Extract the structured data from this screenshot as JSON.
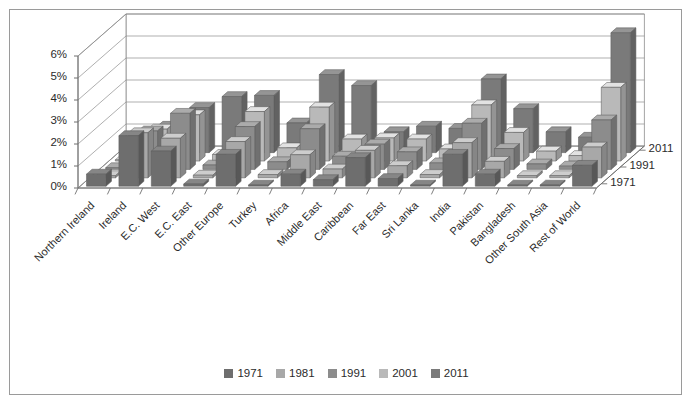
{
  "figure": {
    "border_color": "#9a9a9a",
    "background": "#ffffff"
  },
  "axes": {
    "y_ticks": [
      "0%",
      "1%",
      "2%",
      "3%",
      "4%",
      "5%",
      "6%"
    ],
    "y_min": 0,
    "y_max": 6,
    "y_unit": "%",
    "depth_ticks": [
      "1971",
      "1991",
      "2011"
    ],
    "grid": true
  },
  "legend": {
    "position": "bottom-center",
    "entries": [
      {
        "label": "1971",
        "color": "#6e6e6e"
      },
      {
        "label": "1981",
        "color": "#a8a8a8"
      },
      {
        "label": "1991",
        "color": "#8c8c8c"
      },
      {
        "label": "2001",
        "color": "#b9b9b9"
      },
      {
        "label": "2011",
        "color": "#7a7a7a"
      }
    ]
  },
  "chart_data": {
    "type": "bar",
    "subtype": "3d-clustered-column",
    "title": "",
    "xlabel": "",
    "ylabel": "",
    "ylim": [
      0,
      6
    ],
    "grid": true,
    "categories": [
      "Northern Ireland",
      "Ireland",
      "E.C. West",
      "E.C. East",
      "Other Europe",
      "Turkey",
      "Africa",
      "Middle East",
      "Caribbean",
      "Far East",
      "Sri Lanka",
      "India",
      "Pakistan",
      "Bangladesh",
      "Other South Asia",
      "Rest of World"
    ],
    "series": [
      {
        "name": "1971",
        "color": "#6e6e6e",
        "values": [
          0.55,
          2.3,
          1.6,
          0.1,
          1.45,
          0.05,
          0.55,
          0.3,
          1.3,
          0.35,
          0.05,
          1.45,
          0.55,
          0.02,
          0.05,
          0.95
        ]
      },
      {
        "name": "1981",
        "color": "#a8a8a8",
        "values": [
          0.1,
          2.05,
          1.8,
          0.12,
          1.65,
          0.15,
          1.05,
          0.4,
          1.25,
          0.55,
          0.15,
          1.6,
          0.75,
          0.1,
          0.1,
          1.4
        ]
      },
      {
        "name": "1991",
        "color": "#8c8c8c",
        "values": [
          0.08,
          1.75,
          2.55,
          0.2,
          1.95,
          0.35,
          1.85,
          0.6,
          1.15,
          0.8,
          0.3,
          2.1,
          0.95,
          0.25,
          0.15,
          2.25
        ]
      },
      {
        "name": "2001",
        "color": "#b9b9b9",
        "values": [
          0.05,
          1.45,
          2.1,
          0.3,
          2.25,
          0.6,
          2.45,
          1.0,
          1.05,
          1.0,
          0.55,
          2.55,
          1.3,
          0.45,
          0.25,
          3.35
        ]
      },
      {
        "name": "2011",
        "color": "#7a7a7a",
        "values": [
          0.05,
          1.2,
          2.05,
          2.55,
          2.6,
          1.35,
          3.55,
          3.05,
          0.95,
          1.2,
          1.1,
          3.35,
          2.0,
          0.95,
          0.7,
          5.45
        ]
      }
    ]
  }
}
